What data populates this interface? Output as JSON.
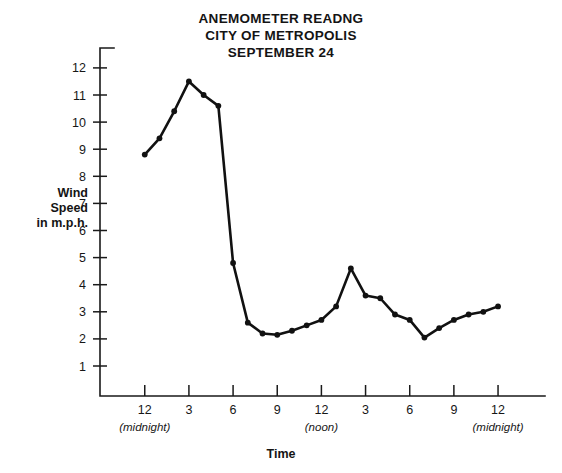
{
  "title": {
    "line1": "ANEMOMETER READNG",
    "line2": "CITY OF METROPOLIS",
    "line3": "SEPTEMBER 24"
  },
  "axis_titles": {
    "y_line1": "Wind",
    "y_line2": "Speed",
    "y_line3": "in m.p.h.",
    "x": "Time"
  },
  "chart_data": {
    "type": "line",
    "title": "ANEMOMETER READNG CITY OF METROPOLIS SEPTEMBER 24",
    "xlabel": "Time",
    "ylabel": "Wind Speed in m.p.h.",
    "xlim": [
      0,
      27
    ],
    "ylim": [
      0,
      12.6
    ],
    "grid": false,
    "legend": null,
    "y_ticks": [
      1,
      2,
      3,
      4,
      5,
      6,
      7,
      8,
      9,
      10,
      11,
      12
    ],
    "y_tick_labels": [
      "1",
      "2",
      "3",
      "4",
      "5",
      "6",
      "7",
      "8",
      "9",
      "10",
      "11",
      "12"
    ],
    "x_ticks": [
      3,
      6,
      9,
      12,
      15,
      18,
      21,
      24,
      27
    ],
    "x_tick_labels": [
      "12",
      "3",
      "6",
      "9",
      "12",
      "3",
      "6",
      "9",
      "12"
    ],
    "x_tick_sublabels": [
      "(midnight)",
      "",
      "",
      "",
      "(noon)",
      "",
      "",
      "",
      "(midnight)"
    ],
    "series_name": "Wind speed",
    "x": [
      3,
      4,
      5,
      6,
      7,
      8,
      9,
      10,
      11,
      12,
      13,
      14,
      15,
      16,
      17,
      18,
      19,
      20,
      21,
      22,
      23,
      24,
      25,
      26,
      27
    ],
    "x_hour_labels": [
      "12am",
      "1am",
      "2am",
      "3am",
      "4am",
      "5am",
      "6am",
      "7am",
      "8am",
      "9am",
      "10am",
      "11am",
      "12pm",
      "1pm",
      "2pm",
      "3pm",
      "4pm",
      "5pm",
      "6pm",
      "7pm",
      "8pm",
      "9pm",
      "10pm",
      "11pm",
      "12am"
    ],
    "values": [
      8.8,
      9.4,
      10.4,
      11.5,
      11.0,
      10.6,
      4.8,
      2.6,
      2.2,
      2.15,
      2.3,
      2.5,
      2.7,
      3.2,
      4.6,
      3.6,
      3.5,
      2.9,
      2.7,
      2.05,
      2.4,
      2.7,
      2.9,
      3.0,
      3.2
    ]
  }
}
